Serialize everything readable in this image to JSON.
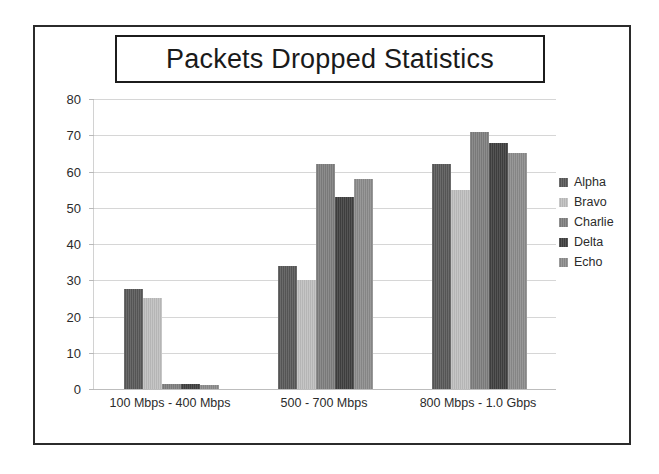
{
  "chart_data": {
    "type": "bar",
    "title": "Packets Dropped Statistics",
    "xlabel": "",
    "ylabel": "",
    "ylim": [
      0,
      80
    ],
    "yticks": [
      0,
      10,
      20,
      30,
      40,
      50,
      60,
      70,
      80
    ],
    "grid": true,
    "legend_position": "right",
    "categories": [
      "100 Mbps - 400 Mbps",
      "500 - 700 Mbps",
      "800 Mbps - 1.0 Gbps"
    ],
    "series": [
      {
        "name": "Alpha",
        "color": "#595959",
        "values": [
          27.5,
          34,
          62
        ]
      },
      {
        "name": "Bravo",
        "color": "#bfbfbf",
        "values": [
          25,
          30,
          55
        ]
      },
      {
        "name": "Charlie",
        "color": "#7f7f7f",
        "values": [
          1.5,
          62,
          71
        ]
      },
      {
        "name": "Delta",
        "color": "#404040",
        "values": [
          1.5,
          53,
          68
        ]
      },
      {
        "name": "Echo",
        "color": "#8c8c8c",
        "values": [
          1,
          58,
          65
        ]
      }
    ]
  },
  "colors": {
    "frame_border": "#2b2b2b",
    "title_border": "#1c1c1c",
    "gridline": "#d6d6d6",
    "text": "#2b2b2b",
    "background": "#ffffff"
  }
}
